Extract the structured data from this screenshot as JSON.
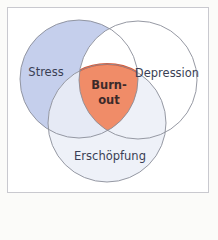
{
  "diagram": {
    "type": "venn",
    "sets": [
      {
        "id": "stress",
        "label": "Stress",
        "color": "#c5cfec"
      },
      {
        "id": "depression",
        "label": "Depression",
        "color": "#ffffff"
      },
      {
        "id": "exhaustion",
        "label": "Erschöpfung",
        "color": "#eef1f8"
      }
    ],
    "intersection": {
      "label_line1": "Burn-",
      "label_line2": "out",
      "color": "#f08c68",
      "stroke": "#e0552f"
    },
    "stroke_color": "#8a8d99"
  }
}
